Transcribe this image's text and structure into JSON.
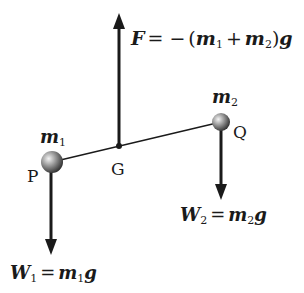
{
  "diagram": {
    "colors": {
      "ink": "#1a1a1a",
      "ball_light": "#e8e8e8",
      "ball_dark": "#3a3a3a"
    },
    "points": {
      "P": {
        "label": "P",
        "mass_label": "m",
        "mass_sub": "1"
      },
      "Q": {
        "label": "Q",
        "mass_label": "m",
        "mass_sub": "2"
      },
      "G": {
        "label": "G"
      }
    },
    "forces": {
      "F": {
        "symbol": "F",
        "equals": "=",
        "minus": "−",
        "open_paren": "(",
        "m1": "m",
        "m1_sub": "1",
        "plus": "+",
        "m2": "m",
        "m2_sub": "2",
        "close_paren": ")",
        "g": "g",
        "direction": "up"
      },
      "W1": {
        "symbol": "W",
        "symbol_sub": "1",
        "equals": "=",
        "m": "m",
        "m_sub": "1",
        "g": "g",
        "direction": "down"
      },
      "W2": {
        "symbol": "W",
        "symbol_sub": "2",
        "equals": "=",
        "m": "m",
        "m_sub": "2",
        "g": "g",
        "direction": "down"
      }
    }
  }
}
